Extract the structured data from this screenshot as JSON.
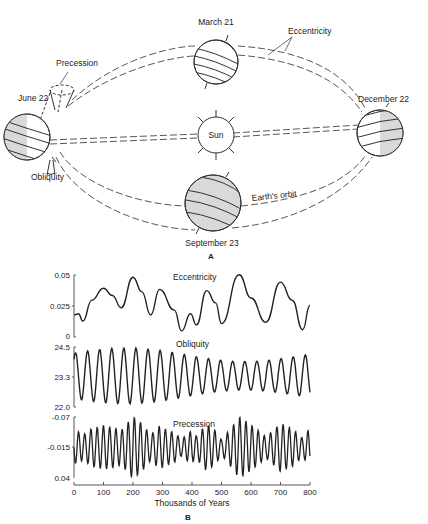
{
  "figure": {
    "panel_a_label": "A",
    "panel_b_label": "B"
  },
  "diagram": {
    "labels": {
      "march": "March 21",
      "june": "June 22",
      "september": "September 23",
      "december": "December 22",
      "sun": "Sun",
      "eccentricity": "Eccentricity",
      "precession": "Precession",
      "obliquity": "Obliquity",
      "orbit": "Earth's orbit"
    },
    "colors": {
      "earth_shade": "#d9d9d9",
      "line": "#333333",
      "background": "#ffffff"
    }
  },
  "chart_data": [
    {
      "type": "line",
      "title": "Eccentricity",
      "xlabel": "Thousands of Years",
      "ylabel": "",
      "xlim": [
        0,
        800
      ],
      "ylim": [
        0,
        0.05
      ],
      "yticks": [
        "0.05",
        "0.025",
        "0"
      ],
      "grid": false,
      "x": [
        0,
        15,
        30,
        60,
        100,
        130,
        160,
        200,
        230,
        260,
        290,
        340,
        365,
        395,
        415,
        450,
        480,
        500,
        560,
        600,
        650,
        700,
        740,
        775,
        800
      ],
      "values": [
        0.018,
        0.019,
        0.013,
        0.03,
        0.04,
        0.034,
        0.024,
        0.049,
        0.037,
        0.018,
        0.039,
        0.022,
        0.005,
        0.019,
        0.01,
        0.038,
        0.028,
        0.011,
        0.051,
        0.032,
        0.012,
        0.045,
        0.03,
        0.006,
        0.026
      ]
    },
    {
      "type": "line",
      "title": "Obliquity",
      "xlabel": "Thousands of Years",
      "ylim": [
        22.0,
        24.5
      ],
      "yticks": [
        "24.5",
        "23.3",
        "22.0"
      ],
      "grid": false,
      "period_kyr": 41,
      "mean": 23.3,
      "amplitude_range": [
        0.7,
        1.2
      ],
      "x": [
        0,
        800
      ]
    },
    {
      "type": "line",
      "title": "Precession",
      "xlabel": "Thousands of Years",
      "ylim": [
        0.04,
        -0.07
      ],
      "yticks": [
        "-0.07",
        "-0.015",
        "0.04"
      ],
      "grid": false,
      "period_kyr": 21,
      "mean": -0.015,
      "x_ticks": [
        "0",
        "100",
        "200",
        "300",
        "400",
        "500",
        "600",
        "700",
        "800"
      ]
    }
  ],
  "axis": {
    "x_ticks": [
      "0",
      "100",
      "200",
      "300",
      "400",
      "500",
      "600",
      "700",
      "800"
    ],
    "x_label": "Thousands of Years",
    "ecc_title": "Eccentricity",
    "obl_title": "Obliquity",
    "pre_title": "Precession",
    "ecc_ticks": [
      "0.05",
      "0.025",
      "0"
    ],
    "obl_ticks": [
      "24.5",
      "23.3",
      "22.0"
    ],
    "pre_ticks": [
      "-0.07",
      "-0.015",
      "0.04"
    ]
  }
}
